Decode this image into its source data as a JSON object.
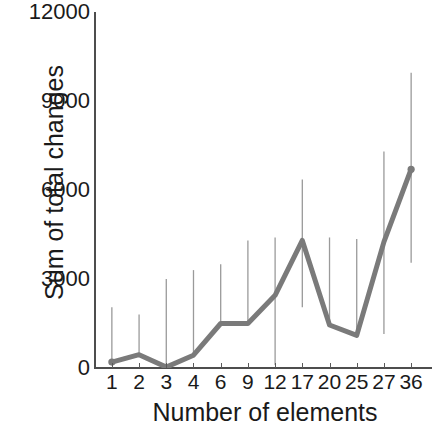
{
  "chart_data": {
    "type": "line",
    "title": "",
    "xlabel": "Number of elements",
    "ylabel": "Sum of total changes",
    "categories": [
      "1",
      "2",
      "3",
      "4",
      "6",
      "9",
      "12",
      "17",
      "20",
      "25",
      "27",
      "36"
    ],
    "values": [
      200,
      450,
      30,
      430,
      1500,
      1500,
      2450,
      4300,
      1450,
      1100,
      4250,
      6700
    ],
    "error_upper": [
      2050,
      1800,
      3000,
      3300,
      3500,
      4300,
      4400,
      6350,
      4400,
      4350,
      7300,
      9950
    ],
    "error_lower": [
      200,
      450,
      30,
      430,
      1500,
      1500,
      100,
      2050,
      1450,
      1100,
      1150,
      3550
    ],
    "ylim": [
      0,
      12000
    ],
    "yticks": [
      0,
      3000,
      6000,
      9000,
      12000
    ],
    "ytick_labels": [
      "0",
      "3000",
      "6000",
      "9000",
      "12000"
    ],
    "grid": false,
    "legend": null,
    "series_color": "#7a7a7a",
    "errorbar_color": "#9a9a9a",
    "axis_color": "#4d4d4d",
    "text_color": "#1a1a1a",
    "marker": "circle"
  }
}
